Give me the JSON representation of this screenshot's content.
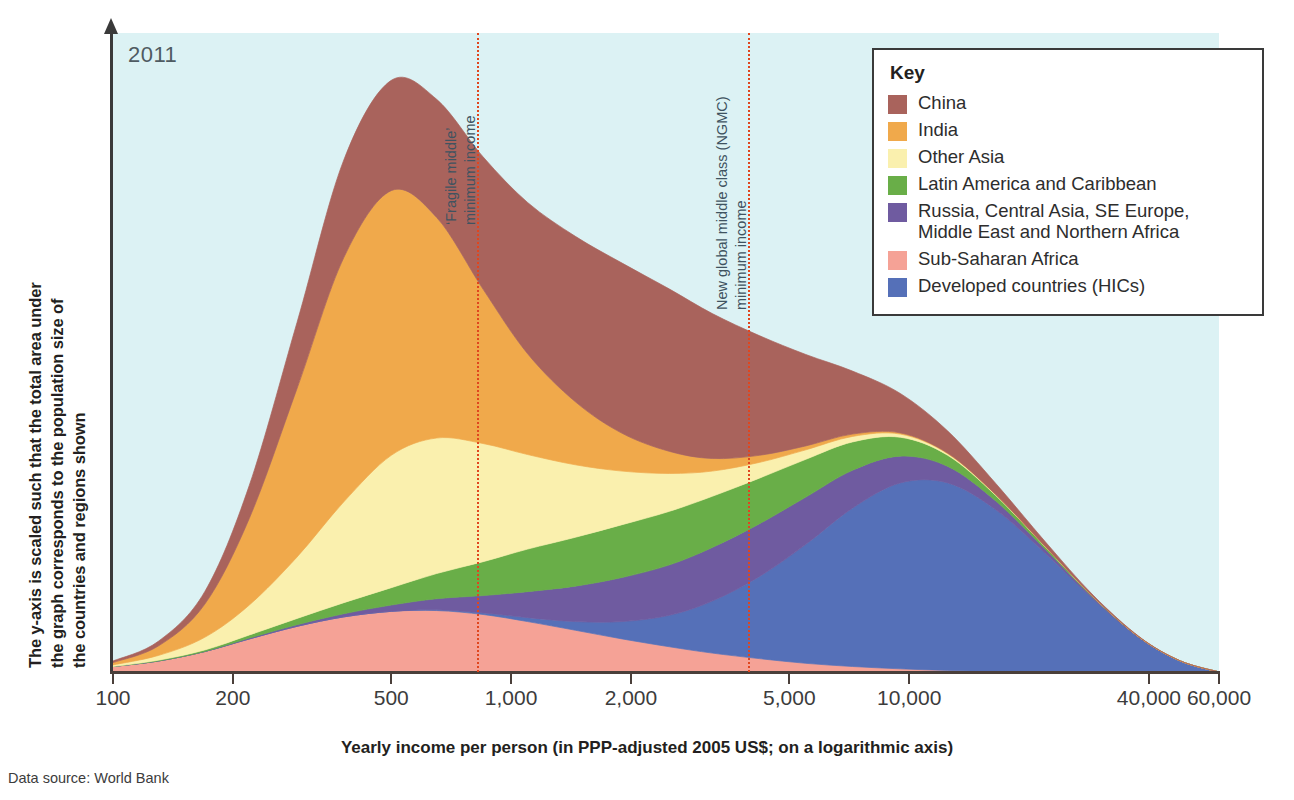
{
  "year_badge": "2011",
  "y_axis_caption": {
    "line1": "The y-axis is scaled such that the total area under",
    "line2": "the graph corresponds to the population size of",
    "line3": "the countries and regions shown"
  },
  "x_axis_title": "Yearly income per person (in PPP-adjusted 2005 US$; on a logarithmic axis)",
  "source_note": "Data source: World Bank",
  "legend": {
    "title": "Key",
    "items": [
      {
        "label": "China",
        "color": "#a9635c"
      },
      {
        "label": "India",
        "color": "#f0a94b"
      },
      {
        "label": "Other Asia",
        "color": "#faf0ae"
      },
      {
        "label": "Latin America and Caribbean",
        "color": "#69ae48"
      },
      {
        "label": "Russia, Central Asia, SE Europe,\nMiddle East and Northern Africa",
        "color": "#6f5ba0"
      },
      {
        "label": "Sub-Saharan Africa",
        "color": "#f5a296"
      },
      {
        "label": "Developed countries (HICs)",
        "color": "#5570b8"
      }
    ]
  },
  "annotations": [
    {
      "id": "fragile-middle",
      "value": 800,
      "line1": "‘Fragile middle’",
      "line2": "minimum income",
      "color": "#e0461e"
    },
    {
      "id": "ngmc",
      "value": 3650,
      "line1": "New global middle class (NGMC)",
      "line2": "minimum income",
      "color": "#e0461e"
    }
  ],
  "chart_data": {
    "type": "area",
    "title": "",
    "subtitle": "2011",
    "xlabel": "Yearly income per person (in PPP-adjusted 2005 US$; on a logarithmic axis)",
    "ylabel": "The y-axis is scaled such that the total area under the graph corresponds to the population size of the countries and regions shown",
    "xscale": "log",
    "xlim": [
      100,
      60000
    ],
    "xticks": [
      100,
      200,
      500,
      1000,
      2000,
      5000,
      10000,
      40000,
      60000
    ],
    "xticklabels": [
      "100",
      "200",
      "500",
      "1,000",
      "2,000",
      "5,000",
      "10,000",
      "40,000",
      "60,000"
    ],
    "yticks": [],
    "grid": false,
    "legend_position": "top-right",
    "stacked": true,
    "plot_bgcolor": "#dcf2f4",
    "x": [
      100,
      130,
      170,
      220,
      290,
      380,
      500,
      650,
      850,
      1100,
      1450,
      1900,
      2500,
      3200,
      4200,
      5500,
      7200,
      9500,
      12500,
      16500,
      22000,
      29000,
      38000,
      48000,
      60000
    ],
    "series": [
      {
        "name": "Sub-Saharan Africa",
        "color": "#f5a296",
        "values": [
          7,
          14,
          26,
          42,
          58,
          70,
          77,
          78,
          73,
          64,
          53,
          42,
          32,
          24,
          17,
          11,
          7,
          4,
          2,
          1,
          0.5,
          0.2,
          0.1,
          0,
          0
        ]
      },
      {
        "name": "Developed countries (HICs)",
        "color": "#5570b8",
        "values": [
          0,
          0,
          0,
          0,
          0,
          0,
          0,
          1,
          2,
          5,
          11,
          22,
          40,
          66,
          104,
          151,
          201,
          236,
          238,
          205,
          150,
          92,
          42,
          14,
          0
        ]
      },
      {
        "name": "Russia, Central Asia, SE Europe, Middle East and Northern Africa",
        "color": "#6f5ba0",
        "values": [
          0,
          0,
          0,
          1,
          2,
          4,
          8,
          14,
          22,
          33,
          45,
          56,
          64,
          68,
          67,
          60,
          48,
          34,
          21,
          11,
          5,
          2,
          1,
          0,
          0
        ]
      },
      {
        "name": "Latin America and Caribbean",
        "color": "#69ae48",
        "values": [
          0,
          1,
          2,
          4,
          8,
          14,
          22,
          32,
          43,
          54,
          62,
          67,
          68,
          65,
          58,
          48,
          36,
          24,
          14,
          7,
          3,
          1,
          0.4,
          0,
          0
        ]
      },
      {
        "name": "Other Asia",
        "color": "#faf0ae",
        "values": [
          2,
          6,
          16,
          38,
          78,
          128,
          168,
          172,
          150,
          120,
          92,
          68,
          48,
          32,
          20,
          12,
          7,
          4,
          2,
          1,
          0.4,
          0.1,
          0,
          0,
          0
        ]
      },
      {
        "name": "India",
        "color": "#f0a94b",
        "values": [
          3,
          12,
          42,
          110,
          214,
          310,
          336,
          280,
          196,
          128,
          80,
          48,
          28,
          16,
          9,
          5,
          3,
          1.5,
          0.8,
          0.3,
          0.1,
          0,
          0,
          0,
          0
        ]
      },
      {
        "name": "China",
        "color": "#a9635c",
        "values": [
          2,
          6,
          16,
          42,
          84,
          124,
          140,
          150,
          168,
          192,
          210,
          216,
          206,
          184,
          152,
          116,
          80,
          50,
          28,
          14,
          6,
          2,
          0.6,
          0.1,
          0
        ]
      }
    ]
  }
}
